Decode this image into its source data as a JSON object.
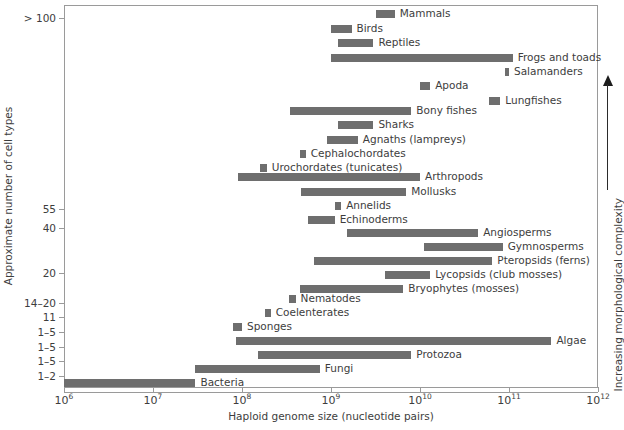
{
  "chart_data": {
    "type": "bar",
    "title": "",
    "subtitle": "",
    "xlabel": "Haploid genome size (nucleotide pairs)",
    "ylabel": "Approximate number of cell types",
    "xscale": "log",
    "xlim": [
      1000000,
      1000000000000
    ],
    "grid": false,
    "legend": null,
    "orientation": "horizontal-ranges",
    "bar_color": "#6e6e6e",
    "annotations": [
      {
        "name": "complexity-arrow",
        "text": "Increasing morphological complexity",
        "direction": "up",
        "position": "right-margin"
      }
    ],
    "xticks": [
      {
        "value": 1000000,
        "base": "10",
        "exp": "6"
      },
      {
        "value": 10000000,
        "base": "10",
        "exp": "7"
      },
      {
        "value": 100000000,
        "base": "10",
        "exp": "8"
      },
      {
        "value": 1000000000,
        "base": "10",
        "exp": "9"
      },
      {
        "value": 10000000000,
        "base": "10",
        "exp": "10"
      },
      {
        "value": 100000000000,
        "base": "10",
        "exp": "11"
      },
      {
        "value": 1000000000000,
        "base": "10",
        "exp": "12"
      }
    ],
    "yticks": [
      {
        "label": "> 100",
        "y": 18
      },
      {
        "label": "55",
        "y": 209
      },
      {
        "label": "40",
        "y": 228
      },
      {
        "label": "20",
        "y": 273
      },
      {
        "label": "14–20",
        "y": 303
      },
      {
        "label": "11",
        "y": 317
      },
      {
        "label": "1–5",
        "y": 332
      },
      {
        "label": "1–5",
        "y": 347
      },
      {
        "label": "1–5",
        "y": 361
      },
      {
        "label": "1–2",
        "y": 376
      }
    ],
    "bars": [
      {
        "name": "mammals",
        "label": "Mammals",
        "x0": 3200000000.0,
        "x1": 5200000000.0,
        "y": 10,
        "label_side": "right"
      },
      {
        "name": "birds",
        "label": "Birds",
        "x0": 1000000000.0,
        "x1": 1700000000.0,
        "y": 25,
        "label_side": "right"
      },
      {
        "name": "reptiles",
        "label": "Reptiles",
        "x0": 1200000000.0,
        "x1": 3000000000.0,
        "y": 39,
        "label_side": "right"
      },
      {
        "name": "frogs-and-toads",
        "label": "Frogs and toads",
        "x0": 1000000000.0,
        "x1": 110000000000.0,
        "y": 54,
        "label_side": "right"
      },
      {
        "name": "salamanders",
        "label": "Salamanders",
        "x0": 90000000000.0,
        "x1": 100000000000.0,
        "y": 68,
        "label_side": "right"
      },
      {
        "name": "apoda",
        "label": "Apoda",
        "x0": 10000000000.0,
        "x1": 13000000000.0,
        "y": 82,
        "label_side": "right"
      },
      {
        "name": "lungfishes",
        "label": "Lungfishes",
        "x0": 60000000000.0,
        "x1": 80000000000.0,
        "y": 97,
        "label_side": "right"
      },
      {
        "name": "bony-fishes",
        "label": "Bony fishes",
        "x0": 350000000.0,
        "x1": 8000000000.0,
        "y": 107,
        "label_side": "right"
      },
      {
        "name": "sharks",
        "label": "Sharks",
        "x0": 1200000000.0,
        "x1": 3000000000.0,
        "y": 121,
        "label_side": "right"
      },
      {
        "name": "agnaths",
        "label": "Agnaths (lampreys)",
        "x0": 900000000.0,
        "x1": 2000000000.0,
        "y": 136,
        "label_side": "right"
      },
      {
        "name": "cephalochordates",
        "label": "Cephalochordates",
        "x0": 450000000.0,
        "x1": 520000000.0,
        "y": 150,
        "label_side": "right"
      },
      {
        "name": "urochordates",
        "label": "Urochordates (tunicates)",
        "x0": 160000000.0,
        "x1": 190000000.0,
        "y": 164,
        "label_side": "right"
      },
      {
        "name": "arthropods",
        "label": "Arthropods",
        "x0": 90000000.0,
        "x1": 10000000000.0,
        "y": 173,
        "label_side": "right"
      },
      {
        "name": "mollusks",
        "label": "Mollusks",
        "x0": 460000000.0,
        "x1": 7000000000.0,
        "y": 188,
        "label_side": "right"
      },
      {
        "name": "annelids",
        "label": "Annelids",
        "x0": 1100000000.0,
        "x1": 1300000000.0,
        "y": 202,
        "label_side": "right"
      },
      {
        "name": "echinoderms",
        "label": "Echinoderms",
        "x0": 550000000.0,
        "x1": 1100000000.0,
        "y": 216,
        "label_side": "right"
      },
      {
        "name": "angiosperms",
        "label": "Angiosperms",
        "x0": 1500000000.0,
        "x1": 45000000000.0,
        "y": 229,
        "label_side": "right"
      },
      {
        "name": "gymnosperms",
        "label": "Gymnosperms",
        "x0": 11000000000.0,
        "x1": 85000000000.0,
        "y": 243,
        "label_side": "right"
      },
      {
        "name": "pteropsids",
        "label": "Pteropsids (ferns)",
        "x0": 650000000.0,
        "x1": 65000000000.0,
        "y": 257,
        "label_side": "right"
      },
      {
        "name": "lycopsids",
        "label": "Lycopsids (club mosses)",
        "x0": 4000000000.0,
        "x1": 13000000000.0,
        "y": 271,
        "label_side": "right"
      },
      {
        "name": "bryophytes",
        "label": "Bryophytes (mosses)",
        "x0": 450000000.0,
        "x1": 6500000000.0,
        "y": 285,
        "label_side": "right"
      },
      {
        "name": "nematodes",
        "label": "Nematodes",
        "x0": 340000000.0,
        "x1": 400000000.0,
        "y": 295,
        "label_side": "right"
      },
      {
        "name": "coelenterates",
        "label": "Coelenterates",
        "x0": 180000000.0,
        "x1": 210000000.0,
        "y": 309,
        "label_side": "right"
      },
      {
        "name": "sponges",
        "label": "Sponges",
        "x0": 80000000.0,
        "x1": 100000000.0,
        "y": 323,
        "label_side": "right"
      },
      {
        "name": "algae",
        "label": "Algae",
        "x0": 85000000.0,
        "x1": 300000000000.0,
        "y": 337,
        "label_side": "right"
      },
      {
        "name": "protozoa",
        "label": "Protozoa",
        "x0": 150000000.0,
        "x1": 8000000000.0,
        "y": 351,
        "label_side": "right"
      },
      {
        "name": "fungi",
        "label": "Fungi",
        "x0": 30000000.0,
        "x1": 750000000.0,
        "y": 365,
        "label_side": "right"
      },
      {
        "name": "bacteria",
        "label": "Bacteria",
        "x0": 1000000.0,
        "x1": 30000000.0,
        "y": 379,
        "label_side": "right"
      }
    ]
  }
}
